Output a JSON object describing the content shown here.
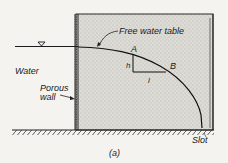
{
  "figure": {
    "caption": "(a)",
    "labels": {
      "free_water_table": "Free water table",
      "water": "Water",
      "porous_wall_line1": "Porous",
      "porous_wall_line2": "wall",
      "point_a": "A",
      "point_b": "B",
      "h": "h",
      "l": "l",
      "slot": "Slot"
    },
    "symbols": {
      "water_surface": "water-level-triangle"
    },
    "colors": {
      "background": "#f4f3ef",
      "medium_fill": "#d9d8d2",
      "ink": "#1a1a1a"
    }
  }
}
